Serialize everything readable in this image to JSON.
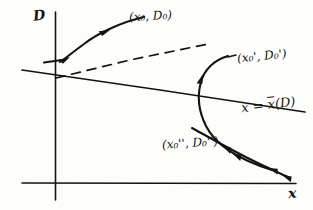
{
  "figure": {
    "background_color": "#fdfdfc",
    "ink_color": "#15130f"
  },
  "axes": {
    "vertical": {
      "name": "D-axis",
      "label": "D",
      "x_px": 55,
      "top_px": 12,
      "bottom_px": 200
    },
    "horizontal": {
      "name": "x-axis",
      "label": "x",
      "y_px": 183,
      "left_px": 22,
      "right_px": 296
    }
  },
  "lines": {
    "xbar_locus": {
      "label_x": "x",
      "label_equals": "=",
      "label_function_base": "x",
      "label_function_arg": "(D)",
      "label_full": "x = x̄(D)",
      "style": "solid",
      "start_px": [
        22,
        70
      ],
      "end_px": [
        305,
        112
      ]
    },
    "dashed_asymptote": {
      "label": "",
      "style": "dashed",
      "start_px": [
        56,
        78
      ],
      "end_px": [
        208,
        44
      ]
    }
  },
  "trajectories": [
    {
      "name": "trajectory-upper",
      "point_label": "(x₀, D₀)",
      "label_parts": {
        "open": "(x",
        "sub1": "0",
        "mid": ", D",
        "sub2": "0",
        "close": ")"
      },
      "direction": "leftward-down toward D-axis",
      "arrow_count": 2
    },
    {
      "name": "trajectory-middle",
      "point_label": "(x₀', D₀')",
      "label_parts": {
        "open": "(x",
        "sub1": "0",
        "prime1": "'",
        "mid": ", D",
        "sub2": "0",
        "prime2": "'",
        "close": ")"
      },
      "direction": "curves down and back to the right",
      "arrow_count": 3
    },
    {
      "name": "trajectory-lower",
      "point_label": "(x₀'', D₀'')",
      "label_parts": {
        "open": "(x",
        "sub1": "0",
        "prime1": "''",
        "mid": ", D",
        "sub2": "0",
        "prime2": "''",
        "close": ")"
      },
      "direction": "descends rightward to the x-axis",
      "arrow_count": 2
    }
  ],
  "annotations": {
    "d_axis_label": "D",
    "x_axis_label": "x",
    "point0": "(x₀, D₀)",
    "point1": "(x₀', D₀')",
    "point2": "(x₀'', D₀'')",
    "locus_label": "x = x̄(D)"
  }
}
